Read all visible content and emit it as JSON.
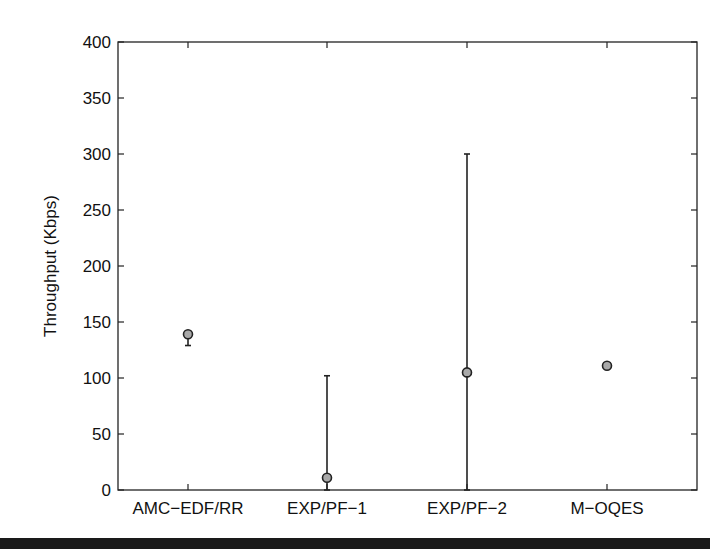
{
  "chart_data": {
    "type": "scatter",
    "subtype": "errorbar",
    "title": "",
    "xlabel": "",
    "ylabel": "Throughput (Kbps)",
    "ylim": [
      0,
      400
    ],
    "yticks": [
      0,
      50,
      100,
      150,
      200,
      250,
      300,
      350,
      400
    ],
    "grid": false,
    "legend": null,
    "categories": [
      "AMC−EDF/RR",
      "EXP/PF−1",
      "EXP/PF−2",
      "M−OQES"
    ],
    "series": [
      {
        "name": "Throughput",
        "values": [
          139,
          11,
          105,
          111
        ],
        "lower": [
          129,
          0,
          0,
          111
        ],
        "upper": [
          139,
          102,
          300,
          111
        ]
      }
    ]
  },
  "style": {
    "axis_color": "#222222",
    "marker_fill": "#a9a9a9",
    "marker_stroke": "#222222",
    "errorbar_color": "#222222",
    "background": "#ffffff"
  }
}
